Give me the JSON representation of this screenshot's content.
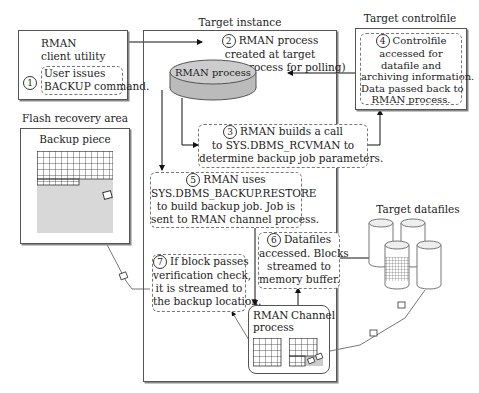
{
  "zones": {
    "client": {
      "title": "RMAN",
      "subtitle": "client utility"
    },
    "target_instance": {
      "title": "Target instance"
    },
    "target_controlfile": {
      "title": "Target controlfile"
    },
    "flash_recovery": {
      "title": "Flash recovery area",
      "backup_piece": "Backup piece"
    },
    "target_datafiles": {
      "title": "Target datafiles"
    }
  },
  "rman_process_label": "RMAN process",
  "channel": {
    "left": "RMAN",
    "left2": "process",
    "right": "Channel"
  },
  "steps": [
    {
      "num": "1",
      "lines": [
        "User issues",
        "BACKUP command."
      ]
    },
    {
      "num": "2",
      "lines": [
        "RMAN process",
        "created at target",
        "(shadow process for polling)"
      ]
    },
    {
      "num": "3",
      "lines": [
        "RMAN builds a call",
        "to SYS.DBMS_RCVMAN to",
        "determine backup job parameters."
      ]
    },
    {
      "num": "4",
      "lines": [
        "Controlfile",
        "accessed for",
        "datafile and",
        "archiving information.",
        "Data passed back to",
        "RMAN process."
      ]
    },
    {
      "num": "5",
      "lines": [
        "RMAN uses",
        "SYS.DBMS_BACKUP.RESTORE",
        "to build backup job. Job is",
        "sent to RMAN channel process."
      ]
    },
    {
      "num": "6",
      "lines": [
        "Datafiles",
        "accessed. Blocks",
        "streamed to",
        "memory buffer."
      ]
    },
    {
      "num": "7",
      "lines": [
        "If block passes",
        "verification check,",
        "it is streamed to",
        "the backup location."
      ]
    }
  ]
}
